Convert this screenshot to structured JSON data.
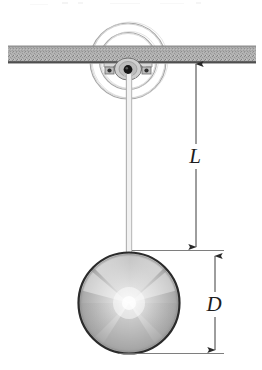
{
  "figure": {
    "type": "physics-line-diagram",
    "width": 262,
    "height": 370,
    "background_color": "#ffffff"
  },
  "labels": {
    "length_label": "L",
    "diameter_label": "D"
  },
  "colors": {
    "ink": "#1d1d1d",
    "beam_fill": "#a8a8a8",
    "beam_edge": "#4a4a4a",
    "sphere_outline": "#2b2b2b",
    "sphere_light": "#f2f2f2",
    "sphere_mid": "#bdbdbd",
    "sphere_dark": "#8e8e8e",
    "rod": "#b4b4b4",
    "pivot_ring": "#9a9a9a",
    "dimension_line": "#4d4d4d"
  },
  "parts": {
    "ceiling_beam": "ceiling-support-beam",
    "pivot_assembly": "pivot-bracket-assembly",
    "pivot_rings": "pivot-concentric-rings",
    "pivot_pin": "pivot-pin",
    "rod": "pendulum-rod",
    "bob": "pendulum-sphere-bob",
    "length_dimension": "length-dimension-L",
    "diameter_dimension": "diameter-dimension-D"
  },
  "geometry": {
    "beam": {
      "x": 8,
      "y": 46,
      "width": 248,
      "height": 17
    },
    "pivot_center": {
      "x": 128,
      "y": 61
    },
    "pivot_outer_radius": 38,
    "pivot_inner_radius": 28,
    "rod": {
      "x1": 126,
      "x2": 132,
      "y_top": 72,
      "y_bottom": 256
    },
    "sphere": {
      "cx": 129,
      "cy": 303,
      "r": 51
    },
    "dimension_L": {
      "x": 196,
      "y_top": 60,
      "y_bottom": 250
    },
    "dimension_D": {
      "x": 215,
      "y_top": 252,
      "y_bottom": 353
    }
  }
}
